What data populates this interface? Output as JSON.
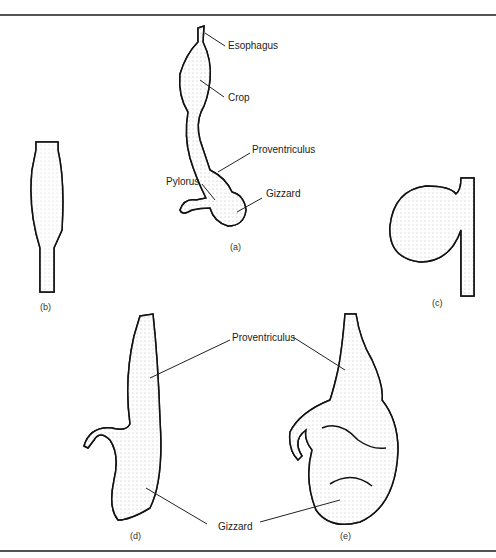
{
  "figure": {
    "panels": [
      {
        "id": "a",
        "caption": "(a)",
        "labels": [
          "Esophagus",
          "Crop",
          "Proventriculus",
          "Pylorus",
          "Gizzard"
        ]
      },
      {
        "id": "b",
        "caption": "(b)"
      },
      {
        "id": "c",
        "caption": "(c)"
      },
      {
        "id": "d",
        "caption": "(d)"
      },
      {
        "id": "e",
        "caption": "(e)"
      }
    ],
    "shared_labels": {
      "proventriculus": "Proventriculus",
      "gizzard": "Gizzard"
    }
  },
  "a": {
    "esophagus": "Esophagus",
    "crop": "Crop",
    "proventriculus": "Proventriculus",
    "pylorus": "Pylorus",
    "gizzard": "Gizzard",
    "caption": "(a)"
  },
  "b": {
    "caption": "(b)"
  },
  "c": {
    "caption": "(c)"
  },
  "d": {
    "caption": "(d)"
  },
  "e": {
    "caption": "(e)"
  }
}
